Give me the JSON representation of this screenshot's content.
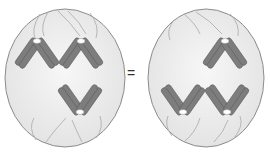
{
  "diagram": {
    "type": "cell-division-comparison",
    "equals_symbol": "=",
    "colors": {
      "cell_fill": "#eeeeee",
      "cell_stroke": "#8c8c8c",
      "spindle": "#a8a8a8",
      "chromatid": "#7a7a7a",
      "chromatid_stroke": "#5a5a5a",
      "centromere": "#ffffff"
    },
    "cells": [
      {
        "name": "left-cell",
        "chromosome_pairs": [
          {
            "position": "upper-left",
            "centromere_toward": "top"
          },
          {
            "position": "upper-right",
            "centromere_toward": "top"
          },
          {
            "position": "lower-center",
            "centromere_toward": "bottom"
          }
        ]
      },
      {
        "name": "right-cell",
        "chromosome_pairs": [
          {
            "position": "upper-right",
            "centromere_toward": "top"
          },
          {
            "position": "lower-left",
            "centromere_toward": "bottom"
          },
          {
            "position": "lower-right",
            "centromere_toward": "bottom"
          }
        ]
      }
    ]
  }
}
